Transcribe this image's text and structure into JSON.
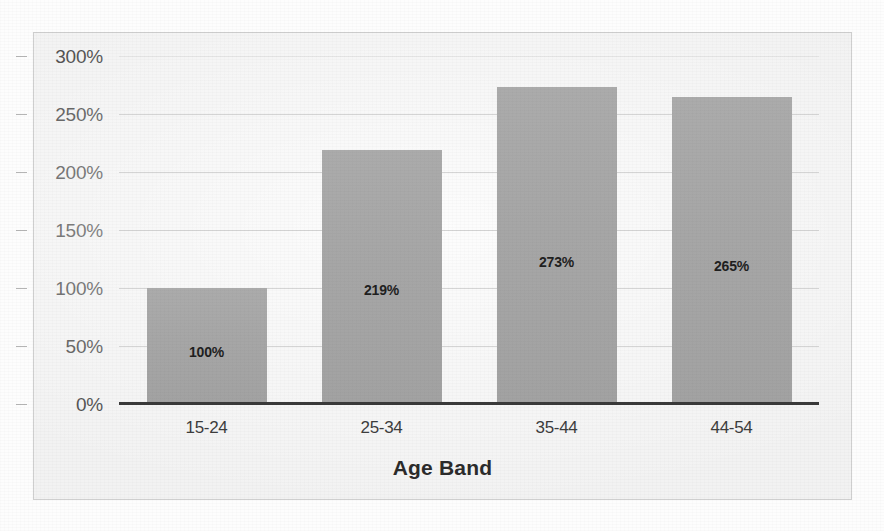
{
  "chart_data": {
    "type": "bar",
    "title": "",
    "subtitle": "",
    "xlabel": "Age Band",
    "ylabel": "",
    "categories": [
      "15-24",
      "25-34",
      "35-44",
      "44-54"
    ],
    "values": [
      100,
      219,
      273,
      265
    ],
    "data_labels": [
      "100%",
      "219%",
      "273%",
      "265%"
    ],
    "ylim": [
      0,
      300
    ],
    "ytick_values": [
      300,
      250,
      200,
      150,
      100,
      50,
      0
    ],
    "ytick_labels": [
      "300%",
      "250%",
      "200%",
      "150%",
      "100%",
      "50%",
      "0%"
    ],
    "ytick_step": 50,
    "grid": true,
    "grid_axis": "y",
    "legend": false,
    "legend_position": "none",
    "annotations": [],
    "series": [
      {
        "name": "",
        "values": [
          100,
          219,
          273,
          265
        ]
      }
    ]
  },
  "style": {
    "bar_color": "#a8a8a8",
    "gridline_color": "#c8c8c8",
    "axis_line_color": "#3a3a3a",
    "plot_background": "#f2f2f2",
    "frame_border_color": "#cfcfcf",
    "tick_label_color": "#3d3d3d",
    "data_label_color": "#1f1f1f",
    "page_background": "#fdfdfd"
  }
}
